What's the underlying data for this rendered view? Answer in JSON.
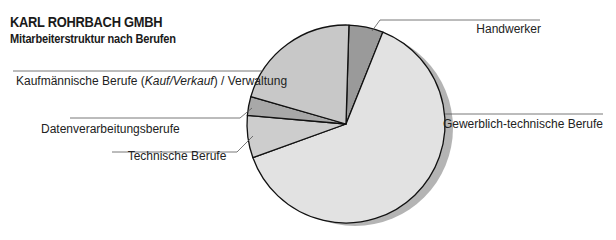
{
  "header": {
    "title": "KARL ROHRBACH GMBH",
    "subtitle": "Mitarbeiterstruktur nach Berufen"
  },
  "chart_data": {
    "type": "pie",
    "title": "KARL ROHRBACH GMBH",
    "subtitle": "Mitarbeiterstruktur nach Berufen",
    "units": "percent (estimated from slice angles)",
    "start_angle_deg": 1.7,
    "direction": "clockwise",
    "slices": [
      {
        "label": "Handwerker",
        "value": 5.6,
        "color": "#9a9a9a"
      },
      {
        "label": "Gewerblich-technische Berufe",
        "value": 63.4,
        "color": "#e2e2e2"
      },
      {
        "label": "Technische Berufe",
        "value": 6.9,
        "color": "#cdcdcd"
      },
      {
        "label": "Datenverarbeitungsberufe",
        "value": 3.1,
        "color": "#a8a8a8"
      },
      {
        "label": "Kaufmännische Berufe (Kauf/Verkauf) / Verwaltung",
        "value": 21.0,
        "color": "#c8c8c8"
      }
    ],
    "legend": "leader-line labels",
    "shadow_color": "#b4b4b4"
  },
  "labels": {
    "handwerker": "Handwerker",
    "gewerblich": "Gewerblich-technische Berufe",
    "technische": "Technische Berufe",
    "datenverarbeitung": "Datenverarbeitungsberufe",
    "kauf_prefix": "Kaufmännische Berufe (",
    "kauf_italic": "Kauf/Verkauf",
    "kauf_suffix": ") / Verwaltung"
  }
}
